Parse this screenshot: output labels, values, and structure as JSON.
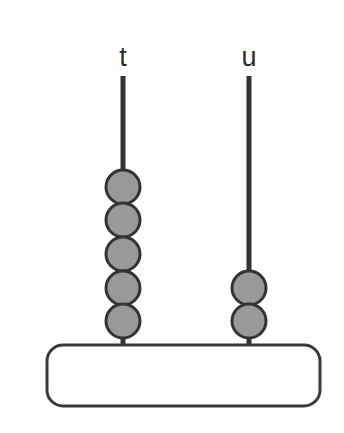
{
  "figure": {
    "type": "abacus",
    "width": 344,
    "height": 433,
    "background_color": "#ffffff"
  },
  "style": {
    "bead_fill": "#999999",
    "bead_stroke": "#333333",
    "bead_stroke_width": 3,
    "rod_color": "#333333",
    "rod_width": 5,
    "base_fill": "#ffffff",
    "base_stroke": "#3a3a3a",
    "base_stroke_width": 3,
    "label_color": "#2b2b2b",
    "label_font_size": 27
  },
  "base": {
    "x": 47,
    "y": 345,
    "width": 273,
    "height": 61,
    "corner_radius": 16
  },
  "rods": [
    {
      "id": "rod-t",
      "label": "t",
      "label_x": 123,
      "label_y": 66,
      "center_x": 123,
      "top_y": 76,
      "bottom_y": 349,
      "bead_count": 5,
      "bead_diameter": 34,
      "bead_first_center_y": 187,
      "bead_pitch": 33.5,
      "beads": [
        {
          "index": 1,
          "cy": 187
        },
        {
          "index": 2,
          "cy": 220
        },
        {
          "index": 3,
          "cy": 254
        },
        {
          "index": 4,
          "cy": 288
        },
        {
          "index": 5,
          "cy": 321
        }
      ]
    },
    {
      "id": "rod-u",
      "label": "u",
      "label_x": 249,
      "label_y": 66,
      "center_x": 249,
      "top_y": 76,
      "bottom_y": 349,
      "bead_count": 2,
      "bead_diameter": 34,
      "bead_first_center_y": 288,
      "bead_pitch": 33.5,
      "beads": [
        {
          "index": 1,
          "cy": 288
        },
        {
          "index": 2,
          "cy": 321
        }
      ]
    }
  ]
}
